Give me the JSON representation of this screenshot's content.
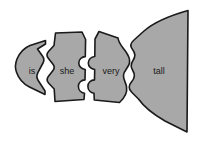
{
  "diagram": {
    "type": "jigsaw-puzzle-sentence",
    "background_color": "#ffffff",
    "piece_fill_color": "#a8a8a8",
    "piece_stroke_color": "#1a1a1a",
    "label_color": "#1a1a1a",
    "sentence": "is she very tall",
    "piece_count": 4,
    "pieces": [
      {
        "id": "piece-is",
        "label": "is",
        "order": 1,
        "label_x": 32,
        "label_y": 72,
        "left_edge": "pointed-concave-tip",
        "right_edge": "v-notch-chevron"
      },
      {
        "id": "piece-she",
        "label": "she",
        "order": 2,
        "label_x": 67,
        "label_y": 72,
        "left_edge": "v-notch-chevron",
        "right_edge": "double-round-tab"
      },
      {
        "id": "piece-very",
        "label": "very",
        "order": 3,
        "label_x": 111,
        "label_y": 72,
        "left_edge": "double-round-socket",
        "right_edge": "wavy-s-curve"
      },
      {
        "id": "piece-tall",
        "label": "tall",
        "order": 4,
        "label_x": 159,
        "label_y": 72,
        "left_edge": "wavy-s-curve",
        "right_edge": "straight-vertical"
      }
    ]
  }
}
